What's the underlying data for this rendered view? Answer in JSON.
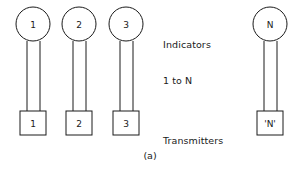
{
  "figure": {
    "caption": "(a)",
    "background_color": "#ffffff",
    "line_color": "#1a1a1a"
  },
  "annotations": {
    "indicators": {
      "line1": "Indicators",
      "line2": "1 to N"
    },
    "transmitters": {
      "line1": "Transmitters",
      "line2": "1 to 'N'"
    }
  },
  "columns": [
    {
      "id": "column-1",
      "indicator_label": "1",
      "transmitter_label": "1",
      "circle_cx": 33,
      "circle_cy": 24,
      "circle_r": 17,
      "cable_left_x": 27,
      "cable_right_x": 40,
      "cable_top_y": 41,
      "cable_bottom_y": 111,
      "box_x": 20,
      "box_y": 111,
      "box_w": 26,
      "box_h": 24
    },
    {
      "id": "column-2",
      "indicator_label": "2",
      "transmitter_label": "2",
      "circle_cx": 79,
      "circle_cy": 24,
      "circle_r": 17,
      "cable_left_x": 73,
      "cable_right_x": 86,
      "cable_top_y": 41,
      "cable_bottom_y": 111,
      "box_x": 66,
      "box_y": 111,
      "box_w": 26,
      "box_h": 24
    },
    {
      "id": "column-3",
      "indicator_label": "3",
      "transmitter_label": "3",
      "circle_cx": 126,
      "circle_cy": 24,
      "circle_r": 17,
      "cable_left_x": 120,
      "cable_right_x": 133,
      "cable_top_y": 41,
      "cable_bottom_y": 111,
      "box_x": 113,
      "box_y": 111,
      "box_w": 26,
      "box_h": 24
    },
    {
      "id": "column-n",
      "indicator_label": "N",
      "transmitter_label": "'N'",
      "circle_cx": 270,
      "circle_cy": 24,
      "circle_r": 17,
      "cable_left_x": 264,
      "cable_right_x": 277,
      "cable_top_y": 41,
      "cable_bottom_y": 111,
      "box_x": 257,
      "box_y": 111,
      "box_w": 26,
      "box_h": 24
    }
  ]
}
